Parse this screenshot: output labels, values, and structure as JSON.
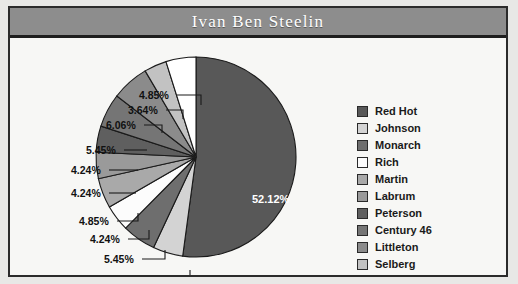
{
  "header": {
    "title": "Ivan Ben Steelin"
  },
  "colors": {
    "window_background": "#e8e8e6",
    "frame_border": "#2b2b2b",
    "title_bar": "#8d8d8d",
    "title_text": "#ffffff",
    "plot_background": "#f7f7f5",
    "label_text": "#111111",
    "slice_outline": "#1a1a1a"
  },
  "chart_data": {
    "type": "pie",
    "title": "Ivan Ben Steelin",
    "legend_position": "right",
    "start_angle_deg": 0,
    "direction": "clockwise",
    "categories": [
      "Red Hot",
      "Johnson",
      "Monarch",
      "Rich",
      "Martin",
      "Labrum",
      "Peterson",
      "Century 46",
      "Littleton",
      "Selberg",
      "Baker"
    ],
    "values": [
      52.12,
      4.85,
      5.45,
      4.24,
      4.85,
      4.24,
      4.24,
      5.45,
      6.06,
      3.64,
      4.85
    ],
    "value_labels": [
      "52.12%",
      "4.85%",
      "5.45%",
      "4.24%",
      "4.85%",
      "4.24%",
      "4.24%",
      "5.45%",
      "6.06%",
      "3.64%",
      "4.85%"
    ],
    "slice_colors": [
      "#585858",
      "#d3d3d3",
      "#6e6e6e",
      "#fcfcfc",
      "#a9a9a9",
      "#9a9a9a",
      "#5f5f5f",
      "#757575",
      "#8b8b8b",
      "#c2c2c2",
      "#ffffff"
    ],
    "units": "percent"
  },
  "legend": {
    "items": [
      {
        "label": "Red Hot",
        "color": "#585858"
      },
      {
        "label": "Johnson",
        "color": "#d3d3d3"
      },
      {
        "label": "Monarch",
        "color": "#6e6e6e"
      },
      {
        "label": "Rich",
        "color": "#fcfcfc"
      },
      {
        "label": "Martin",
        "color": "#a9a9a9"
      },
      {
        "label": "Labrum",
        "color": "#9a9a9a"
      },
      {
        "label": "Peterson",
        "color": "#5f5f5f"
      },
      {
        "label": "Century 46",
        "color": "#757575"
      },
      {
        "label": "Littleton",
        "color": "#8b8b8b"
      },
      {
        "label": "Selberg",
        "color": "#c2c2c2"
      },
      {
        "label": "Baker",
        "color": "#ffffff"
      }
    ]
  },
  "callouts": [
    {
      "text": "4.85%",
      "x": 129,
      "y": 48,
      "line_x1": 167,
      "line_y1": 54,
      "line_x2": 191,
      "line_y2": 54,
      "tick_down": 10
    },
    {
      "text": "3.64%",
      "x": 118,
      "y": 63,
      "line_x1": 156,
      "line_y1": 69,
      "line_x2": 173,
      "line_y2": 69,
      "tick_down": 9
    },
    {
      "text": "6.06%",
      "x": 96,
      "y": 78,
      "line_x1": 134,
      "line_y1": 84,
      "line_x2": 152,
      "line_y2": 84,
      "tick_down": 8
    },
    {
      "text": "5.45%",
      "x": 76,
      "y": 103,
      "line_x1": 114,
      "line_y1": 109,
      "line_x2": 137,
      "line_y2": 109,
      "tick_down": 0
    },
    {
      "text": "4.24%",
      "x": 61,
      "y": 123,
      "line_x1": 99,
      "line_y1": 129,
      "line_x2": 128,
      "line_y2": 129,
      "tick_down": 0
    },
    {
      "text": "4.24%",
      "x": 61,
      "y": 146,
      "line_x1": 99,
      "line_y1": 152,
      "line_x2": 126,
      "line_y2": 152,
      "tick_down": 0
    },
    {
      "text": "4.85%",
      "x": 69,
      "y": 174,
      "line_x1": 107,
      "line_y1": 180,
      "line_x2": 128,
      "line_y2": 180,
      "tick_down": -8
    },
    {
      "text": "4.24%",
      "x": 80,
      "y": 192,
      "line_x1": 118,
      "line_y1": 198,
      "line_x2": 139,
      "line_y2": 198,
      "tick_down": -9
    },
    {
      "text": "5.45%",
      "x": 94,
      "y": 212,
      "line_x1": 132,
      "line_y1": 218,
      "line_x2": 155,
      "line_y2": 218,
      "tick_down": -9
    },
    {
      "text": "4.85%",
      "x": 116,
      "y": 233,
      "line_x1": 154,
      "line_y1": 239,
      "line_x2": 180,
      "line_y2": 239,
      "tick_down": -10
    }
  ],
  "center_label": {
    "text": "52.12%",
    "x": 242,
    "y": 152
  }
}
